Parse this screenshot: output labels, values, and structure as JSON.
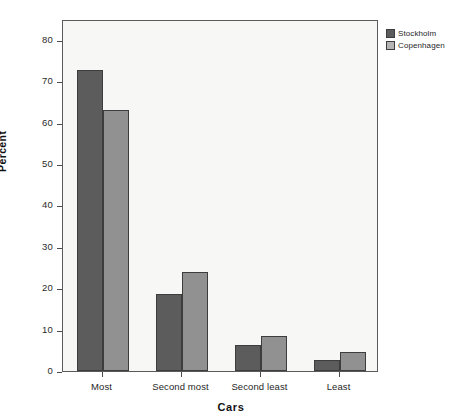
{
  "chart_data": {
    "type": "bar",
    "title": "",
    "xlabel": "Cars",
    "ylabel": "Percent",
    "categories": [
      "Most",
      "Second most",
      "Second least",
      "Least"
    ],
    "series": [
      {
        "name": "Stockholm",
        "color": "#5c5c5c",
        "values": [
          72.6,
          18.7,
          6.2,
          2.7
        ]
      },
      {
        "name": "Copenhagen",
        "color": "#919191",
        "values": [
          63.1,
          24.0,
          8.4,
          4.5
        ]
      }
    ],
    "ylim": [
      0,
      85
    ],
    "yticks": [
      0,
      10,
      20,
      30,
      40,
      50,
      60,
      70,
      80
    ],
    "ytick_labels": [
      "0",
      "10",
      "20",
      "30",
      "40",
      "50",
      "60",
      "70",
      "80"
    ],
    "grid": false,
    "legend_position": "right-top",
    "legend_entries": [
      "Stockholm",
      "Copenhagen"
    ]
  },
  "axis": {
    "y_title": "Percent",
    "x_title": "Cars"
  },
  "legend": {
    "items": [
      {
        "label": "Stockholm"
      },
      {
        "label": "Copenhagen"
      }
    ]
  }
}
